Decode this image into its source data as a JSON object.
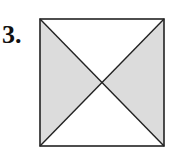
{
  "problem": {
    "number_label": "3."
  },
  "figure": {
    "shape": "square",
    "square": {
      "x1": 40,
      "y1": 19,
      "x2": 164,
      "y2": 146
    },
    "center": {
      "x": 102,
      "y": 82.5
    },
    "shaded_regions": [
      "left-triangle",
      "right-triangle"
    ],
    "unshaded_regions": [
      "top-triangle",
      "bottom-triangle"
    ],
    "colors": {
      "shade": "#dcdcdc",
      "stroke": "#222222",
      "background": "#ffffff"
    }
  }
}
